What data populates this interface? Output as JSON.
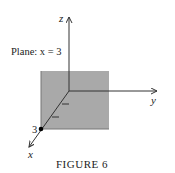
{
  "figure": {
    "caption": "FIGURE 6",
    "plane_label": "Plane: x = 3",
    "axes": {
      "z_label": "z",
      "y_label": "y",
      "x_label": "x"
    },
    "point_label": "3",
    "colors": {
      "plane_fill": "#a9a9a9",
      "plane_edge": "#777777",
      "axis": "#333333",
      "point": "#000000"
    }
  }
}
